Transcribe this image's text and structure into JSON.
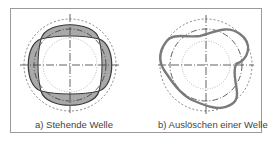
{
  "figure": {
    "panels": [
      {
        "id": "a",
        "caption": "a) Stehende Welle",
        "type": "standing-wave"
      },
      {
        "id": "b",
        "caption": "b) Auslöschen einer Welle",
        "type": "wave-cancellation"
      }
    ],
    "colors": {
      "fill": "#a9a9a9",
      "stroke": "#3a3a3a",
      "wave_b": "#7a7a7a",
      "dashed": "#6a6a6a",
      "frame": "#9a9a9a"
    }
  }
}
